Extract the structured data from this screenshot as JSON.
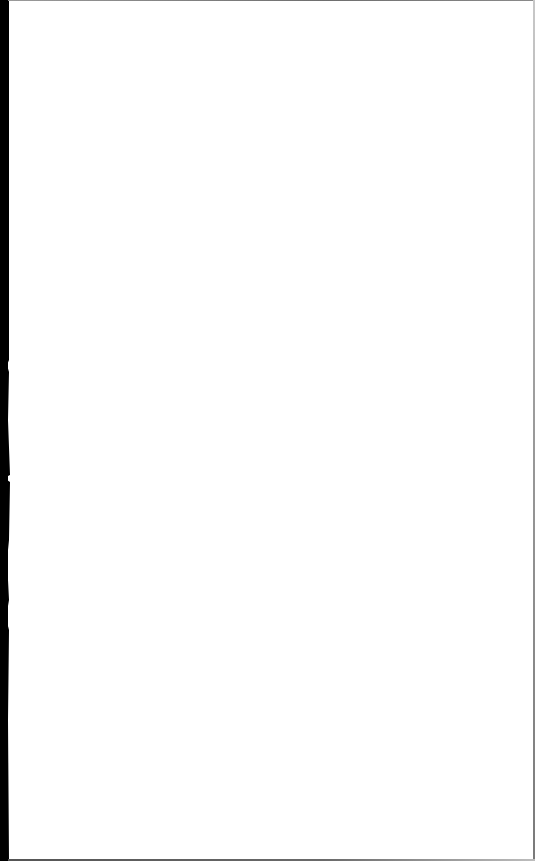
{
  "document": {
    "type": "blank-scanned-page",
    "content_text": "",
    "colors": {
      "paper": "#ffffff",
      "scan_edge": "#000000",
      "border": "#7a7a7a"
    }
  }
}
